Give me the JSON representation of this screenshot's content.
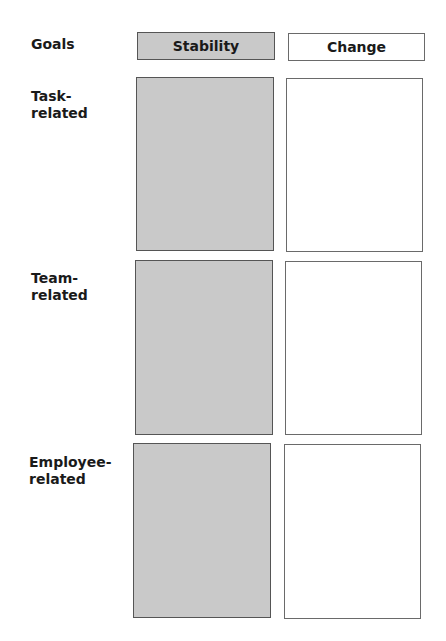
{
  "diagram": {
    "row_header_label": "Goals",
    "columns": [
      {
        "label": "Stability",
        "fill": "#c9c9c9"
      },
      {
        "label": "Change",
        "fill": "#ffffff"
      }
    ],
    "rows": [
      {
        "label_line1": "Task-",
        "label_line2": "related"
      },
      {
        "label_line1": "Team-",
        "label_line2": "related"
      },
      {
        "label_line1": "Employee-",
        "label_line2": "related"
      }
    ]
  }
}
